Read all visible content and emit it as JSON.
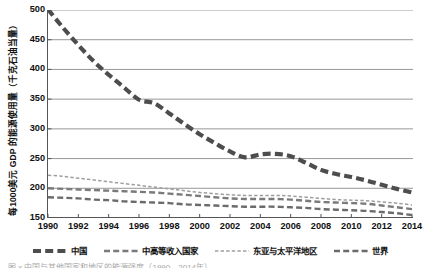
{
  "chart_data": {
    "type": "line",
    "title": "",
    "xlabel": "",
    "ylabel": "每1000美元 GDP 的能源使用量（千克石油当量）",
    "xlim": [
      1990,
      2014
    ],
    "ylim": [
      150,
      500
    ],
    "yticks": [
      500,
      450,
      400,
      350,
      300,
      250,
      200,
      150
    ],
    "xticks": [
      1990,
      1992,
      1994,
      1996,
      1998,
      2000,
      2002,
      2004,
      2006,
      2008,
      2010,
      2012,
      2014
    ],
    "grid": "horizontal",
    "legend_position": "bottom",
    "x": [
      1990,
      1991,
      1992,
      1993,
      1994,
      1995,
      1996,
      1997,
      1998,
      1999,
      2000,
      2001,
      2002,
      2003,
      2004,
      2005,
      2006,
      2007,
      2008,
      2009,
      2010,
      2011,
      2012,
      2013,
      2014
    ],
    "series": [
      {
        "name": "中国",
        "color": "#4d4d4d",
        "style": "thick-dashed",
        "values": [
          501,
          470,
          441,
          414,
          391,
          370,
          349,
          343,
          326,
          308,
          291,
          276,
          262,
          252,
          257,
          258,
          254,
          243,
          231,
          224,
          219,
          213,
          206,
          199,
          193
        ]
      },
      {
        "name": "中高等收入国家",
        "color": "#7a7a7a",
        "style": "medium-dashed",
        "values": [
          200,
          199,
          198,
          197,
          196,
          195,
          194,
          193,
          191,
          189,
          187,
          185,
          183,
          182,
          182,
          182,
          181,
          179,
          177,
          176,
          175,
          174,
          171,
          168,
          165
        ]
      },
      {
        "name": "东亚与太平洋地区",
        "color": "#9e9e9e",
        "style": "fine-dashed",
        "values": [
          222,
          220,
          217,
          214,
          211,
          208,
          205,
          202,
          199,
          196,
          193,
          191,
          189,
          188,
          188,
          188,
          187,
          185,
          183,
          181,
          180,
          179,
          177,
          175,
          172
        ]
      },
      {
        "name": "世界",
        "color": "#6b6b6b",
        "style": "medium-dashed",
        "values": [
          185,
          184,
          183,
          181,
          180,
          178,
          177,
          176,
          175,
          173,
          172,
          171,
          170,
          169,
          169,
          169,
          168,
          167,
          165,
          164,
          163,
          162,
          160,
          158,
          155
        ]
      }
    ]
  },
  "caption": {
    "text": "图 x 中国与其他国家和地区的能源强度（1990—2014年）"
  }
}
